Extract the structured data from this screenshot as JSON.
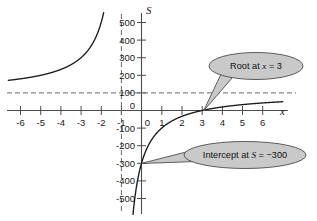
{
  "chart_data": {
    "type": "line",
    "title": "",
    "xlabel": "x",
    "ylabel": "S",
    "xlim": [
      -6.6,
      7.0
    ],
    "ylim": [
      -560,
      520
    ],
    "grid": false,
    "legend": "none",
    "x_ticks": [
      "-6",
      "-5",
      "-4",
      "-3",
      "-2",
      "-1",
      "0",
      "1",
      "2",
      "3",
      "4",
      "5",
      "6"
    ],
    "x_tick_values": [
      -6,
      -5,
      -4,
      -3,
      -2,
      -1,
      0,
      1,
      2,
      3,
      4,
      5,
      6
    ],
    "y_ticks": [
      "500",
      "400",
      "300",
      "200",
      "100",
      "0",
      "-100",
      "-200",
      "-300",
      "-400",
      "-500"
    ],
    "y_tick_values": [
      500,
      400,
      300,
      200,
      100,
      0,
      -100,
      -200,
      -300,
      -400,
      -500
    ],
    "series": [
      {
        "name": "S = 100(x - 3)/(x + 1)",
        "formula_a": 100,
        "formula_root": 3,
        "formula_pole": -1,
        "branches": [
          {
            "name": "left-branch",
            "x_start": -6.6,
            "x_end": -1.08,
            "points": [
              [
                -6.6,
                160.7
              ],
              [
                -6.0,
                175.0
              ],
              [
                -5.5,
                188.9
              ],
              [
                -5.0,
                200.0
              ],
              [
                -4.5,
                214.3
              ],
              [
                -4.0,
                233.3
              ],
              [
                -3.5,
                260.0
              ],
              [
                -3.0,
                300.0
              ],
              [
                -2.5,
                366.7
              ],
              [
                -2.2,
                433.3
              ],
              [
                -2.0,
                500.0
              ],
              [
                -1.8,
                600.0
              ],
              [
                -1.5,
                900.0
              ],
              [
                -1.2,
                2100.0
              ],
              [
                -1.08,
                5100.0
              ]
            ]
          },
          {
            "name": "right-branch",
            "x_start": -0.93,
            "x_end": 7.0,
            "points": [
              [
                -0.93,
                -5614.0
              ],
              [
                -0.8,
                -1900.0
              ],
              [
                -0.6,
                -900.0
              ],
              [
                -0.4,
                -566.7
              ],
              [
                -0.2,
                -400.0
              ],
              [
                0.0,
                -300.0
              ],
              [
                0.5,
                -166.7
              ],
              [
                1.0,
                -100.0
              ],
              [
                1.5,
                -60.0
              ],
              [
                2.0,
                -33.3
              ],
              [
                2.5,
                -14.3
              ],
              [
                3.0,
                0.0
              ],
              [
                3.5,
                11.1
              ],
              [
                4.0,
                20.0
              ],
              [
                4.5,
                27.3
              ],
              [
                5.0,
                33.3
              ],
              [
                5.5,
                38.5
              ],
              [
                6.0,
                42.9
              ],
              [
                6.5,
                46.7
              ],
              [
                7.0,
                50.0
              ]
            ]
          }
        ]
      }
    ],
    "asymptotes": [
      {
        "name": "horizontal-asymptote",
        "orientation": "horizontal",
        "value": 100,
        "style": "dashed"
      },
      {
        "name": "vertical-asymptote",
        "orientation": "vertical",
        "value": -1,
        "style": "dashed"
      }
    ],
    "annotations": [
      {
        "name": "root-callout",
        "text": "Root at x = 3",
        "text_parts": {
          "prefix": "Root at ",
          "variable": "x",
          "equals": " = ",
          "value": "3"
        },
        "points_to": {
          "x": 3,
          "y": 0
        }
      },
      {
        "name": "intercept-callout",
        "text": "Intercept at S = -300",
        "text_parts": {
          "prefix": "Intercept at ",
          "variable": "S",
          "equals": " = ",
          "value": "−300"
        },
        "points_to": {
          "x": 0,
          "y": -300
        }
      }
    ],
    "colors": {
      "curve": "#1a1a1a",
      "axis": "#4d4d4d",
      "asymptote": "#6b6b6b",
      "callout_fill": "#c9c9c9",
      "callout_stroke": "#4d4d4d",
      "background": "#ffffff",
      "text": "#1a1a1a"
    }
  }
}
